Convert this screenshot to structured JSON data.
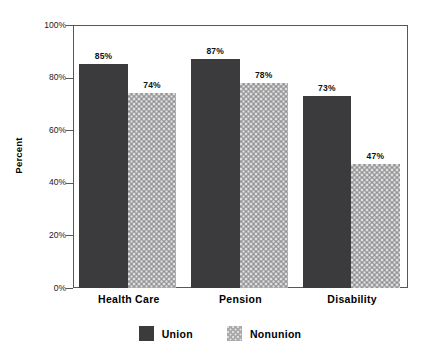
{
  "chart_data": {
    "type": "bar",
    "title": "",
    "subtitle": "",
    "xlabel": "",
    "ylabel": "Percent",
    "categories": [
      "Health Care",
      "Pension",
      "Disability"
    ],
    "series": [
      {
        "name": "Union",
        "values": [
          85,
          87,
          73
        ],
        "color": "#3b3b3d",
        "fill": "solid"
      },
      {
        "name": "Nonunion",
        "values": [
          74,
          78,
          47
        ],
        "color": "#a9a9ab",
        "fill": "dotted-texture"
      }
    ],
    "data_labels": [
      [
        "85%",
        "74%"
      ],
      [
        "87%",
        "78%"
      ],
      [
        "73%",
        "47%"
      ]
    ],
    "ylim": [
      0,
      100
    ],
    "ytick_values": [
      0,
      20,
      40,
      60,
      80,
      100
    ],
    "ytick_labels": [
      "0%",
      "20%",
      "40%",
      "60%",
      "80%",
      "100%"
    ],
    "grid": true,
    "grid_axis": "y",
    "legend_position": "bottom-center",
    "legend_entries": [
      "Union",
      "Nonunion"
    ],
    "frame": true,
    "background_color": "#ffffff"
  }
}
